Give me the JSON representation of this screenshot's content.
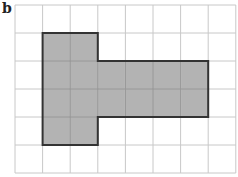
{
  "panel_label": "b",
  "grid": {
    "cols": 8,
    "rows": 6,
    "origin_x": 15,
    "origin_y": 5,
    "cell_w": 27.6,
    "cell_h": 28,
    "line_color": "#c8c8c8",
    "fill_line_color": "#999999"
  },
  "shape": {
    "fill": "#b3b3b3",
    "stroke": "#333333",
    "stroke_width": 2,
    "outline_cells": [
      [
        1,
        1
      ],
      [
        3,
        1
      ],
      [
        3,
        2
      ],
      [
        7,
        2
      ],
      [
        7,
        4
      ],
      [
        3,
        4
      ],
      [
        3,
        5
      ],
      [
        1,
        5
      ]
    ],
    "shaded_cells": [
      [
        1,
        1
      ],
      [
        2,
        1
      ],
      [
        1,
        2
      ],
      [
        2,
        2
      ],
      [
        3,
        2
      ],
      [
        4,
        2
      ],
      [
        5,
        2
      ],
      [
        6,
        2
      ],
      [
        1,
        3
      ],
      [
        2,
        3
      ],
      [
        3,
        3
      ],
      [
        4,
        3
      ],
      [
        5,
        3
      ],
      [
        6,
        3
      ],
      [
        1,
        4
      ],
      [
        2,
        4
      ]
    ]
  }
}
